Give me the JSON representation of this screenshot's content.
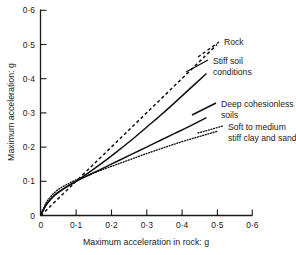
{
  "chart_data": {
    "type": "line",
    "title": "",
    "xlabel": "Maximum acceleration in rock: g",
    "ylabel": "Maximum acceleration: g",
    "xlim": [
      0,
      0.6
    ],
    "ylim": [
      0,
      0.6
    ],
    "xticks": [
      "0",
      "0·1",
      "0·2",
      "0·3",
      "0·4",
      "0·5",
      "0·6"
    ],
    "yticks": [
      "0",
      "0·1",
      "0·2",
      "0·3",
      "0·4",
      "0·5",
      "0·6"
    ],
    "xtick_values": [
      0,
      0.1,
      0.2,
      0.3,
      0.4,
      0.5,
      0.6
    ],
    "ytick_values": [
      0,
      0.1,
      0.2,
      0.3,
      0.4,
      0.5,
      0.6
    ],
    "grid": false,
    "legend_position": "inline-annotations",
    "series": [
      {
        "name": "Rock",
        "style": "dashed",
        "x": [
          0,
          0.02,
          0.04,
          0.06,
          0.08,
          0.1,
          0.14,
          0.18,
          0.22,
          0.26,
          0.3,
          0.34,
          0.38,
          0.42,
          0.46,
          0.5
        ],
        "y": [
          0,
          0.02,
          0.04,
          0.06,
          0.08,
          0.1,
          0.14,
          0.18,
          0.22,
          0.26,
          0.3,
          0.34,
          0.38,
          0.42,
          0.46,
          0.5
        ]
      },
      {
        "name": "Stiff soil conditions",
        "style": "solid",
        "x": [
          0,
          0.01,
          0.02,
          0.04,
          0.06,
          0.08,
          0.1,
          0.14,
          0.18,
          0.22,
          0.26,
          0.3,
          0.34,
          0.38,
          0.42,
          0.47
        ],
        "y": [
          0,
          0.022,
          0.038,
          0.06,
          0.075,
          0.088,
          0.1,
          0.128,
          0.158,
          0.19,
          0.223,
          0.258,
          0.293,
          0.33,
          0.368,
          0.415
        ]
      },
      {
        "name": "Deep cohesionless soils",
        "style": "solid",
        "x": [
          0,
          0.01,
          0.02,
          0.04,
          0.06,
          0.08,
          0.1,
          0.14,
          0.18,
          0.22,
          0.26,
          0.3,
          0.34,
          0.38,
          0.42,
          0.47
        ],
        "y": [
          0,
          0.022,
          0.038,
          0.06,
          0.075,
          0.088,
          0.1,
          0.12,
          0.14,
          0.16,
          0.18,
          0.2,
          0.22,
          0.24,
          0.26,
          0.286
        ]
      },
      {
        "name": "Soft to medium stiff clay and sand",
        "style": "dotted",
        "x": [
          0,
          0.01,
          0.02,
          0.04,
          0.06,
          0.08,
          0.1,
          0.14,
          0.18,
          0.22,
          0.26,
          0.3,
          0.34,
          0.38,
          0.42,
          0.46,
          0.5
        ],
        "y": [
          0,
          0.026,
          0.045,
          0.068,
          0.083,
          0.094,
          0.104,
          0.12,
          0.136,
          0.151,
          0.166,
          0.181,
          0.195,
          0.209,
          0.222,
          0.234,
          0.246
        ]
      }
    ],
    "annotations": [
      {
        "text": "Rock",
        "lines": [
          "Rock"
        ]
      },
      {
        "text": "Stiff soil conditions",
        "lines": [
          "Stiff soil",
          "conditions"
        ]
      },
      {
        "text": "Deep cohesionless soils",
        "lines": [
          "Deep cohesionless",
          "soils"
        ]
      },
      {
        "text": "Soft to medium stiff clay and sand",
        "lines": [
          "Soft to medium",
          "stiff clay and sand"
        ]
      }
    ]
  }
}
